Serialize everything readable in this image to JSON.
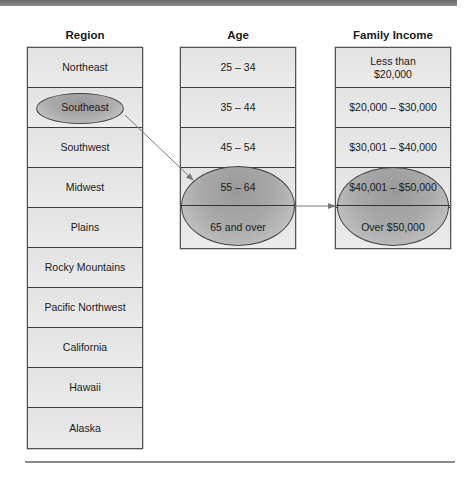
{
  "diagram": {
    "columns": [
      {
        "header": "Region",
        "cells": [
          "Northeast",
          "Southeast",
          "Southwest",
          "Midwest",
          "Plains",
          "Rocky Mountains",
          "Pacific Northwest",
          "California",
          "Hawaii",
          "Alaska"
        ],
        "highlighted": [
          "Southeast"
        ]
      },
      {
        "header": "Age",
        "cells": [
          "25 – 34",
          "35 – 44",
          "45 – 54",
          "55 – 64",
          "65 and over"
        ],
        "highlighted": [
          "55 – 64",
          "65 and over"
        ]
      },
      {
        "header": "Family Income",
        "cells": [
          "Less than\n$20,000",
          "$20,000 – $30,000",
          "$30,001 – $40,000",
          "$40,001 – $50,000",
          "Over $50,000"
        ],
        "highlighted": [
          "$40,001 – $50,000",
          "Over $50,000"
        ]
      }
    ],
    "connections": [
      {
        "from": "Region: Southeast",
        "to": "Age: 55 – 64 / 65 and over"
      },
      {
        "from": "Age: 55 – 64 / 65 and over",
        "to": "Family Income: $40,001 – $50,000 / Over $50,000"
      }
    ],
    "colors": {
      "cell_fill": "#e6e6e6",
      "border": "#3a3a3a",
      "highlight_ellipse": "#9a9a9a",
      "arrow": "#777777",
      "top_bar": "#777777"
    }
  }
}
